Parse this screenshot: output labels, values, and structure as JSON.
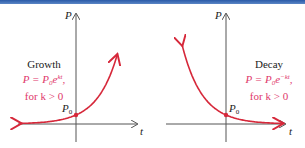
{
  "colors": {
    "curve": "#d6283a",
    "equation": "#e0386b",
    "axis": "#555555",
    "topbar": "#2a5aa8"
  },
  "growth": {
    "title": "Growth",
    "equation_lhs": "P = P",
    "equation_sub": "0",
    "equation_base": "e",
    "equation_exp": "kt",
    "equation_trail": ",",
    "condition": "for k > 0",
    "y_axis_label": "P",
    "x_axis_label": "t",
    "intercept_label": "P",
    "intercept_sub": "0"
  },
  "decay": {
    "title": "Decay",
    "equation_lhs": "P = P",
    "equation_sub": "0",
    "equation_base": "e",
    "equation_exp": "−kt",
    "equation_trail": ",",
    "condition": "for k > 0",
    "y_axis_label": "P",
    "x_axis_label": "t",
    "intercept_label": "P",
    "intercept_sub": "0"
  }
}
